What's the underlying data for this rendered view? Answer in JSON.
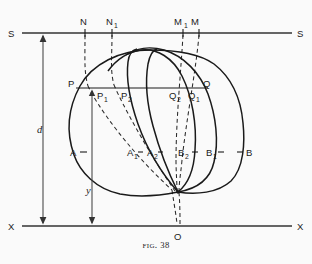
{
  "figure": {
    "caption_label": "Fig.",
    "caption_number": "38",
    "axis_lines": [
      {
        "name": "S-S",
        "left_label": "S",
        "right_label": "S",
        "y": 33
      },
      {
        "name": "X-X",
        "left_label": "X",
        "right_label": "X",
        "y": 226
      }
    ],
    "dimensions": [
      {
        "name": "d",
        "label": "d",
        "from_y": 33,
        "to_y": 226,
        "x": 43
      },
      {
        "name": "y",
        "label": "y",
        "from_y": 88,
        "to_y": 226,
        "x": 92
      }
    ],
    "points": [
      {
        "id": "N",
        "label": "N",
        "sub": "",
        "x": 85,
        "y": 22
      },
      {
        "id": "N1",
        "label": "N",
        "sub": "1",
        "x": 112,
        "y": 22
      },
      {
        "id": "M1",
        "label": "M",
        "sub": "1",
        "x": 183,
        "y": 22
      },
      {
        "id": "M",
        "label": "M",
        "sub": "",
        "x": 199,
        "y": 22
      },
      {
        "id": "P",
        "label": "P",
        "sub": "",
        "x": 73,
        "y": 84
      },
      {
        "id": "P1",
        "label": "P",
        "sub": "1",
        "x": 102,
        "y": 97
      },
      {
        "id": "P2",
        "label": "P",
        "sub": "2",
        "x": 128,
        "y": 97
      },
      {
        "id": "Q2",
        "label": "Q",
        "sub": "2",
        "x": 178,
        "y": 97
      },
      {
        "id": "Q1",
        "label": "Q",
        "sub": "1",
        "x": 197,
        "y": 97
      },
      {
        "id": "Q",
        "label": "Q",
        "sub": "",
        "x": 205,
        "y": 84
      },
      {
        "id": "A",
        "label": "A",
        "sub": "",
        "x": 74,
        "y": 155
      },
      {
        "id": "A1",
        "label": "A",
        "sub": "1",
        "x": 131,
        "y": 155
      },
      {
        "id": "A2",
        "label": "A",
        "sub": "2",
        "x": 152,
        "y": 155
      },
      {
        "id": "B2",
        "label": "B",
        "sub": "2",
        "x": 184,
        "y": 155
      },
      {
        "id": "B1",
        "label": "B",
        "sub": "1",
        "x": 212,
        "y": 155
      },
      {
        "id": "B",
        "label": "B",
        "sub": "",
        "x": 243,
        "y": 155
      },
      {
        "id": "O",
        "label": "O",
        "sub": "",
        "x": 178,
        "y": 236
      }
    ],
    "colors": {
      "ink": "#1a1a1a",
      "rule": "#3a3a3a",
      "dashed": "#2b2b2b",
      "paper": "#fafafa"
    }
  }
}
